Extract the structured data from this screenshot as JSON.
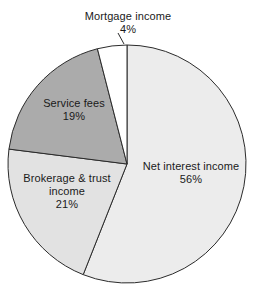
{
  "chart_data": {
    "type": "pie",
    "title": "",
    "subtitle": "",
    "xlabel": "",
    "ylabel": "",
    "legend_position": "none",
    "grid": false,
    "units": "percent",
    "total": 100,
    "start_angle_deg": 0,
    "direction": "clockwise",
    "categories": [
      "Net interest income",
      "Brokerage & trust income",
      "Service fees",
      "Mortgage income"
    ],
    "values": [
      56,
      21,
      19,
      4
    ],
    "slices": [
      {
        "label": "Net interest income",
        "label_line1": "Net interest income",
        "value": 56,
        "value_text": "56%",
        "color": "#ececec"
      },
      {
        "label": "Brokerage & trust income",
        "label_line1": "Brokerage & trust",
        "label_line2": "income",
        "value": 21,
        "value_text": "21%",
        "color": "#e2e2e2"
      },
      {
        "label": "Service fees",
        "label_line1": "Service fees",
        "value": 19,
        "value_text": "19%",
        "color": "#ababab"
      },
      {
        "label": "Mortgage income",
        "label_line1": "Mortgage income",
        "value": 4,
        "value_text": "4%",
        "color": "#ffffff"
      }
    ],
    "outline_color": "#2b2b2b",
    "background": "#ffffff"
  },
  "labels": {
    "mortgage": {
      "name": "Mortgage income",
      "pct": "4%"
    },
    "service": {
      "name": "Service fees",
      "pct": "19%"
    },
    "brokerage": {
      "name_line1": "Brokerage & trust",
      "name_line2": "income",
      "pct": "21%"
    },
    "netinterest": {
      "name": "Net interest income",
      "pct": "56%"
    }
  }
}
